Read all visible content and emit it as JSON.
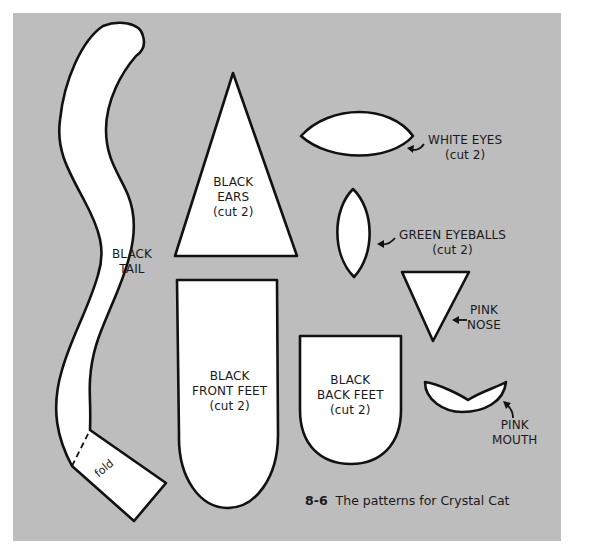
{
  "figure": {
    "number": "8-6",
    "caption": "The patterns for Crystal Cat",
    "background_color": "#bdbdbd",
    "piece_fill": "#ffffff",
    "outline_color": "#111111"
  },
  "pieces": [
    {
      "id": "tail",
      "lines": [
        "BLACK",
        "TAIL"
      ],
      "fold_label": "fold"
    },
    {
      "id": "ears",
      "lines": [
        "BLACK",
        "EARS",
        "(cut 2)"
      ]
    },
    {
      "id": "white_eyes",
      "lines": [
        "WHITE EYES",
        "(cut 2)"
      ]
    },
    {
      "id": "green_eyeballs",
      "lines": [
        "GREEN EYEBALLS",
        "(cut 2)"
      ]
    },
    {
      "id": "nose",
      "lines": [
        "PINK",
        "NOSE"
      ]
    },
    {
      "id": "front_feet",
      "lines": [
        "BLACK",
        "FRONT FEET",
        "(cut 2)"
      ]
    },
    {
      "id": "back_feet",
      "lines": [
        "BLACK",
        "BACK FEET",
        "(cut 2)"
      ]
    },
    {
      "id": "mouth",
      "lines": [
        "PINK",
        "MOUTH"
      ]
    }
  ]
}
